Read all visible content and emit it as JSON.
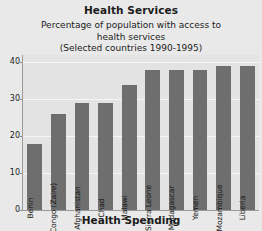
{
  "chart_data": {
    "type": "bar",
    "title": "Health Services",
    "subtitle_lines": [
      "Percentage of population with access to",
      "health services",
      "(Selected countries 1990-1995)"
    ],
    "xlabel": "Health Spending",
    "ylabel": "",
    "ylim": [
      0,
      42
    ],
    "yticks": [
      0,
      10,
      20,
      30,
      40
    ],
    "ytick_labels": [
      "0",
      "10",
      "20",
      "30",
      "40"
    ],
    "grid": true,
    "legend": "none",
    "bar_color": "#6e6e6e",
    "plot_background": "#e3e3e3",
    "categories": [
      "Benin",
      "Congo (Zaire)",
      "Afghanistan",
      "Chad",
      "Malawi",
      "Sierra Leone",
      "Madagascar",
      "Yemen",
      "Mozambique",
      "Liberia"
    ],
    "values": [
      18,
      26,
      29,
      29,
      34,
      38,
      38,
      38,
      39,
      39
    ]
  }
}
